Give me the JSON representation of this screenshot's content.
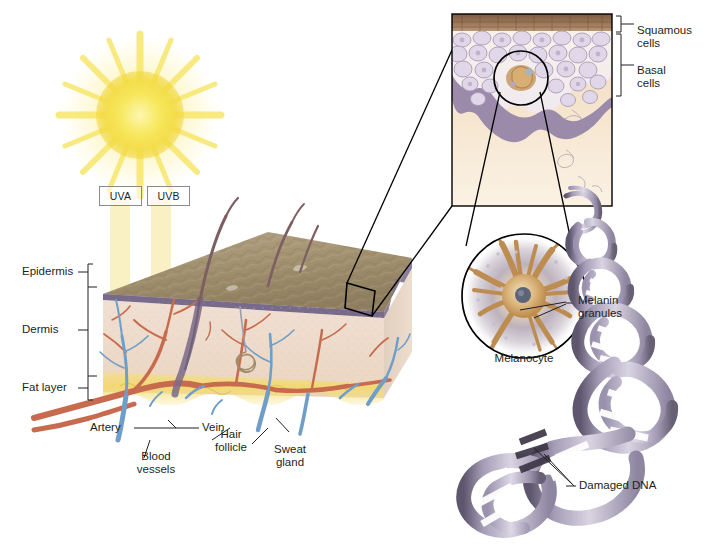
{
  "figure": {
    "type": "medical-illustration"
  },
  "radiation": {
    "uva_label": "UVA",
    "uvb_label": "UVB"
  },
  "skin_layers": [
    {
      "label": "Epidermis"
    },
    {
      "label": "Dermis"
    },
    {
      "label": "Fat layer"
    }
  ],
  "structures": [
    {
      "label": "Artery"
    },
    {
      "label": "Vein"
    },
    {
      "label": "Blood\nvessels"
    },
    {
      "label": "Hair\nfollicle"
    },
    {
      "label": "Sweat\ngland"
    }
  ],
  "inset_epidermis": {
    "squamous_label": "Squamous\ncells",
    "basal_label": "Basal\ncells"
  },
  "melanocyte_inset": {
    "cell_label": "Melanocyte",
    "granules_label": "Melanin\ngranules"
  },
  "dna": {
    "damage_label": "Damaged DNA"
  },
  "colors": {
    "sun": "#f6e04b",
    "sun_glow": "#fdf3a8",
    "uv_beam": "#f7edb6",
    "epidermis_surface": "#9c8a6a",
    "basal_band": "#8d7fa0",
    "dermis": "#efddcc",
    "fat": "#f2db70",
    "artery": "#c96a4f",
    "vein": "#6f9ec9",
    "keratinocyte": "#ded7e6",
    "melanocyte_body": "#c08a4e",
    "dna_ribbon": "#b5aec6",
    "dna_damage": "#3c3646",
    "line": "#231f20"
  }
}
